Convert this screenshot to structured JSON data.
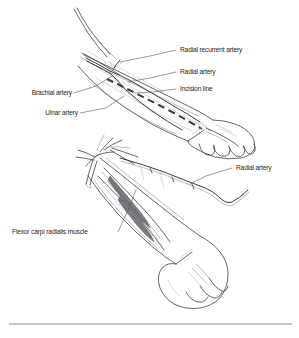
{
  "figure": {
    "panels": [
      {
        "id": "upper",
        "name": "Surface anatomy of forearm with planned incision",
        "view": "anterior forearm, closed fist"
      },
      {
        "id": "lower",
        "name": "Dissected forearm exposing radial artery",
        "view": "anterior forearm, retracted and dissected"
      }
    ],
    "colors": {
      "background": "#ffffff",
      "line": "#4a4a4e",
      "vessel": "#3c3c40",
      "incision": "#3a3a3e",
      "leader": "#55555a",
      "text": "#1d1d20",
      "rule": "#8e8e94"
    }
  },
  "labels": {
    "radial_recurrent_artery": "Radial recurrent artery",
    "radial_artery_upper": "Radial artery",
    "incision_line": "Incision line",
    "brachial_artery": "Brachial artery",
    "ulnar_artery": "Ulnar artery",
    "radial_artery_lower": "Radial artery",
    "flexor_carpi_radialis_muscle": "Flexor carpi radialis muscle"
  }
}
